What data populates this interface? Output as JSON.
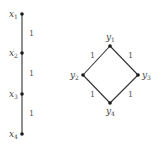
{
  "graphs": [
    {
      "name": "chain",
      "nodes": [
        {
          "id": "x1",
          "base": "x",
          "sub": "1"
        },
        {
          "id": "x2",
          "base": "x",
          "sub": "2"
        },
        {
          "id": "x3",
          "base": "x",
          "sub": "3"
        },
        {
          "id": "x4",
          "base": "x",
          "sub": "4"
        }
      ],
      "edges": [
        {
          "from": "x1",
          "to": "x2",
          "weight": "1"
        },
        {
          "from": "x2",
          "to": "x3",
          "weight": "1"
        },
        {
          "from": "x3",
          "to": "x4",
          "weight": "1"
        }
      ]
    },
    {
      "name": "diamond",
      "nodes": [
        {
          "id": "y1",
          "base": "y",
          "sub": "1"
        },
        {
          "id": "y2",
          "base": "y",
          "sub": "2"
        },
        {
          "id": "y3",
          "base": "y",
          "sub": "3"
        },
        {
          "id": "y4",
          "base": "y",
          "sub": "4"
        }
      ],
      "edges": [
        {
          "from": "y1",
          "to": "y2",
          "weight": "1"
        },
        {
          "from": "y1",
          "to": "y3",
          "weight": "1"
        },
        {
          "from": "y2",
          "to": "y4",
          "weight": "1"
        },
        {
          "from": "y3",
          "to": "y4",
          "weight": "1"
        }
      ]
    }
  ]
}
